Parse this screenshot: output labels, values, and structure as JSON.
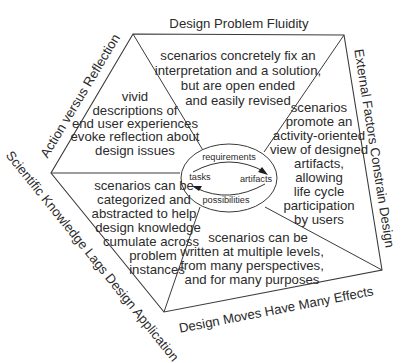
{
  "diagram": {
    "edge_labels": {
      "top": "Design Problem Fluidity",
      "right": "External Factors Constrain Design",
      "bottom": "Design Moves Have Many Effects",
      "lower_left": "Scientific Knowledge Lags Design Application",
      "upper_left": "Action versus Reflection"
    },
    "segments": {
      "top": [
        "scenarios concretely fix an",
        "interpretation and a solution,",
        "but are open ended",
        "and easily revised"
      ],
      "right": [
        "scenarios",
        "promote an",
        "activity-oriented",
        "view of designed",
        "artifacts,",
        "allowing",
        "life cycle",
        "participation",
        "by users"
      ],
      "bottom": [
        "scenarios can be",
        "written at multiple levels,",
        "from many perspectives,",
        "and for many purposes"
      ],
      "lower_left": [
        "scenarios can be",
        "categorized and",
        "abstracted to help",
        "design knowledge",
        "cumulate across",
        "problem",
        "instances"
      ],
      "upper_left": [
        "vivid",
        "descriptions of",
        "end user experiences",
        "evoke reflection about",
        "design issues"
      ]
    },
    "cycle": {
      "top": "requirements",
      "right": "artifacts",
      "bottom": "possibilities",
      "left": "tasks"
    },
    "colors": {
      "line": "#3a3a3a",
      "text": "#2b2b2b",
      "background": "#ffffff"
    }
  }
}
